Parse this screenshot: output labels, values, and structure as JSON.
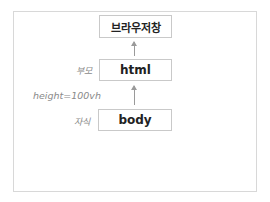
{
  "diagram": {
    "nodes": [
      {
        "id": "browser-window",
        "label": "브라우저창"
      },
      {
        "id": "html",
        "label": "html"
      },
      {
        "id": "body",
        "label": "body"
      }
    ],
    "edges": [
      {
        "from": "html",
        "to": "browser-window"
      },
      {
        "from": "body",
        "to": "html"
      }
    ],
    "annotations": {
      "parent": "부모",
      "height": "height=100vh",
      "child": "자식"
    },
    "colors": {
      "box_border": "#c9c9c9",
      "arrow": "#9a9a9a",
      "annotation_text": "#8a8a8a",
      "frame_border": "#d8d8d8"
    }
  }
}
